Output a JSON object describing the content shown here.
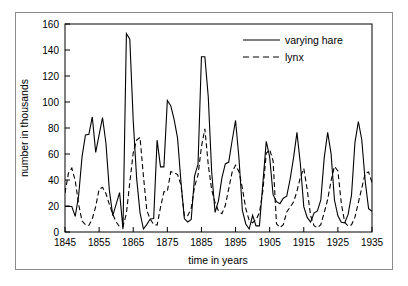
{
  "chart_data": {
    "type": "line",
    "title": "",
    "xlabel": "time in years",
    "ylabel": "number in thousands",
    "xlim": [
      1845,
      1935
    ],
    "ylim": [
      0,
      160
    ],
    "xticks": [
      1845,
      1855,
      1865,
      1875,
      1885,
      1895,
      1905,
      1915,
      1925,
      1935
    ],
    "xtick_labels": [
      "1845",
      "1855",
      "1865",
      "1875",
      "1885",
      "1895",
      "1905",
      "1915",
      "1925",
      "1935"
    ],
    "yticks": [
      0,
      20,
      40,
      60,
      80,
      100,
      120,
      140,
      160
    ],
    "ytick_labels": [
      "0",
      "20",
      "40",
      "60",
      "80",
      "100",
      "120",
      "140",
      "160"
    ],
    "grid": false,
    "legend_position": "top-right",
    "x": [
      1845,
      1846,
      1847,
      1848,
      1849,
      1850,
      1851,
      1852,
      1853,
      1854,
      1855,
      1856,
      1857,
      1858,
      1859,
      1860,
      1861,
      1862,
      1863,
      1864,
      1865,
      1866,
      1867,
      1868,
      1869,
      1870,
      1871,
      1872,
      1873,
      1874,
      1875,
      1876,
      1877,
      1878,
      1879,
      1880,
      1881,
      1882,
      1883,
      1884,
      1885,
      1886,
      1887,
      1888,
      1889,
      1890,
      1891,
      1892,
      1893,
      1894,
      1895,
      1896,
      1897,
      1898,
      1899,
      1900,
      1901,
      1902,
      1903,
      1904,
      1905,
      1906,
      1907,
      1908,
      1909,
      1910,
      1911,
      1912,
      1913,
      1914,
      1915,
      1916,
      1917,
      1918,
      1919,
      1920,
      1921,
      1922,
      1923,
      1924,
      1925,
      1926,
      1927,
      1928,
      1929,
      1930,
      1931,
      1932,
      1933,
      1934,
      1935
    ],
    "series": [
      {
        "name": "varying hare",
        "style": "solid",
        "color": "#000000",
        "values": [
          19.58,
          19.6,
          19.61,
          11.99,
          28.04,
          58.0,
          74.6,
          75.09,
          88.48,
          61.28,
          74.67,
          88.06,
          68.51,
          32.19,
          12.64,
          21.49,
          30.35,
          2.18,
          152.65,
          148.36,
          85.81,
          41.41,
          14.75,
          2.28,
          5.91,
          9.95,
          10.44,
          70.64,
          50.12,
          50.13,
          101.25,
          97.12,
          86.51,
          72.17,
          38.32,
          10.11,
          7.74,
          9.67,
          43.12,
          52.21,
          134.85,
          134.86,
          103.79,
          46.1,
          15.03,
          24.2,
          41.65,
          52.34,
          53.78,
          70.4,
          85.81,
          56.69,
          16.59,
          6.16,
          2.3,
          12.82,
          4.72,
          4.73,
          37.22,
          69.72,
          57.78,
          28.68,
          23.37,
          21.8,
          26.03,
          27.6,
          40.56,
          57.0,
          76.6,
          52.35,
          19.5,
          11.2,
          7.6,
          14.6,
          16.2,
          24.7,
          57.2,
          76.6,
          60.3,
          24.6,
          12.5,
          7.5,
          7.0,
          13.5,
          28.5,
          68.8,
          85.0,
          71.0,
          39.2,
          18.0,
          16.0
        ]
      },
      {
        "name": "lynx",
        "style": "dashed",
        "color": "#000000",
        "values": [
          30.09,
          45.15,
          49.15,
          39.52,
          21.23,
          8.42,
          5.56,
          5.08,
          10.17,
          19.6,
          32.91,
          34.38,
          29.59,
          21.3,
          13.69,
          7.65,
          4.08,
          4.09,
          14.33,
          38.22,
          60.78,
          70.77,
          72.77,
          42.68,
          16.39,
          9.83,
          5.8,
          5.26,
          18.91,
          30.95,
          31.18,
          46.34,
          45.77,
          44.15,
          36.33,
          12.03,
          12.6,
          18.34,
          35.14,
          43.77,
          65.69,
          79.35,
          51.65,
          32.59,
          22.45,
          16.16,
          14.12,
          20.38,
          33.33,
          46.0,
          51.41,
          46.43,
          33.68,
          18.01,
          8.86,
          7.13,
          9.47,
          14.86,
          31.47,
          60.57,
          63.51,
          54.7,
          6.3,
          3.4,
          5.6,
          15.4,
          19.1,
          23.0,
          31.4,
          42.0,
          49.0,
          32.6,
          12.6,
          4.9,
          3.2,
          5.7,
          15.0,
          25.0,
          39.4,
          50.5,
          47.0,
          22.0,
          7.5,
          4.5,
          5.6,
          11.4,
          22.6,
          33.8,
          45.0,
          46.2,
          38.0
        ]
      }
    ]
  },
  "legend": {
    "items": [
      {
        "label": "varying hare",
        "style": "solid"
      },
      {
        "label": "lynx",
        "style": "dashed"
      }
    ]
  },
  "axes": {
    "x_title": "time in years",
    "y_title": "number in thousands"
  }
}
